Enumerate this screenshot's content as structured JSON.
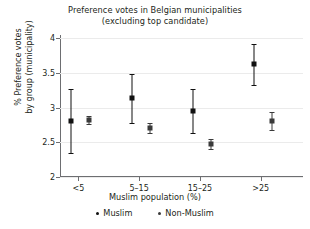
{
  "chart_data": {
    "type": "scatter",
    "title": "Preference votes in Belgian municipalities",
    "subtitle": "(excluding top candidate)",
    "xlabel": "Muslim population (%)",
    "ylabel_line1": "% Preference votes",
    "ylabel_line2": "by group (municipality)",
    "categories": [
      "<5",
      "5–15",
      "15–25",
      ">25"
    ],
    "ylim": [
      2,
      4
    ],
    "yticks": [
      2,
      2.5,
      3,
      3.5,
      4
    ],
    "ytick_labels": [
      "2",
      "2.5",
      "3",
      "3.5",
      "4"
    ],
    "grid": true,
    "legend_position": "bottom",
    "series": [
      {
        "name": "Muslim",
        "color": "#111111",
        "values": [
          2.81,
          3.13,
          2.95,
          3.62
        ],
        "ci_low": [
          2.34,
          2.78,
          2.63,
          3.33
        ],
        "ci_high": [
          3.26,
          3.48,
          3.27,
          3.92
        ]
      },
      {
        "name": "Non-Muslim",
        "color": "#3a3a3a",
        "values": [
          2.82,
          2.7,
          2.47,
          2.8
        ],
        "ci_low": [
          2.76,
          2.64,
          2.4,
          2.67
        ],
        "ci_high": [
          2.88,
          2.77,
          2.55,
          2.93
        ]
      }
    ]
  },
  "legend": {
    "items": [
      {
        "label": "Muslim"
      },
      {
        "label": "Non-Muslim"
      }
    ]
  }
}
